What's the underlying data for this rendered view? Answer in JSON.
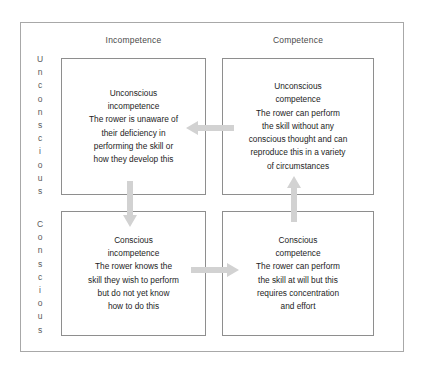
{
  "diagram": {
    "frame_border_color": "#a8a8a8",
    "box_border_color": "#8e8e8e",
    "text_color": "#1d1d1d",
    "header_color": "#4a4a4a",
    "arrow_color": "#d2d2d2",
    "columns": [
      {
        "key": "incompetence",
        "label": "Incompetence"
      },
      {
        "key": "competence",
        "label": "Competence"
      }
    ],
    "rows": [
      {
        "key": "unconscious",
        "label": "Unconscious",
        "letters": [
          "U",
          "n",
          "c",
          "o",
          "n",
          "s",
          "c",
          "i",
          "o",
          "u",
          "s"
        ]
      },
      {
        "key": "conscious",
        "label": "Conscious",
        "letters": [
          "C",
          "o",
          "n",
          "s",
          "c",
          "i",
          "o",
          "u",
          "s"
        ]
      }
    ],
    "quadrants": {
      "unconscious_incompetence": {
        "heading": "Unconscious\nincompetence",
        "body": "The rower is unaware of\ntheir deficiency in\nperforming the skill or\nhow they develop this",
        "text": "Unconscious\nincompetence\nThe rower is unaware of\ntheir deficiency in\nperforming the skill or\nhow they develop this"
      },
      "unconscious_competence": {
        "heading": "Unconscious\ncompetence",
        "body": "The rower can perform\nthe skill without any\nconscious thought and can\nreproduce this in a variety\nof circumstances",
        "text": "Unconscious\ncompetence\nThe rower can perform\nthe skill without any\nconscious thought and can\nreproduce this in a variety\nof circumstances"
      },
      "conscious_incompetence": {
        "heading": "Conscious\nincompetence",
        "body": "The rower knows the\nskill they wish to perform\nbut do not yet know\nhow to do this",
        "text": "Conscious\nincompetence\nThe rower knows the\nskill they wish to perform\nbut do not yet know\nhow to do this"
      },
      "conscious_competence": {
        "heading": "Conscious\ncompetence",
        "body": "The rower can perform\nthe skill at will but this\nrequires concentration\nand effort",
        "text": "Conscious\ncompetence\nThe rower can perform\nthe skill at will but this\nrequires concentration\nand effort"
      }
    },
    "arrows": [
      {
        "name": "arrow-top-right-to-left",
        "direction": "left",
        "from": "unconscious_competence",
        "to": "unconscious_incompetence"
      },
      {
        "name": "arrow-left-down",
        "direction": "down",
        "from": "unconscious_incompetence",
        "to": "conscious_incompetence"
      },
      {
        "name": "arrow-bottom-left-to-right",
        "direction": "right",
        "from": "conscious_incompetence",
        "to": "conscious_competence"
      },
      {
        "name": "arrow-right-up",
        "direction": "up",
        "from": "conscious_competence",
        "to": "unconscious_competence"
      }
    ]
  }
}
